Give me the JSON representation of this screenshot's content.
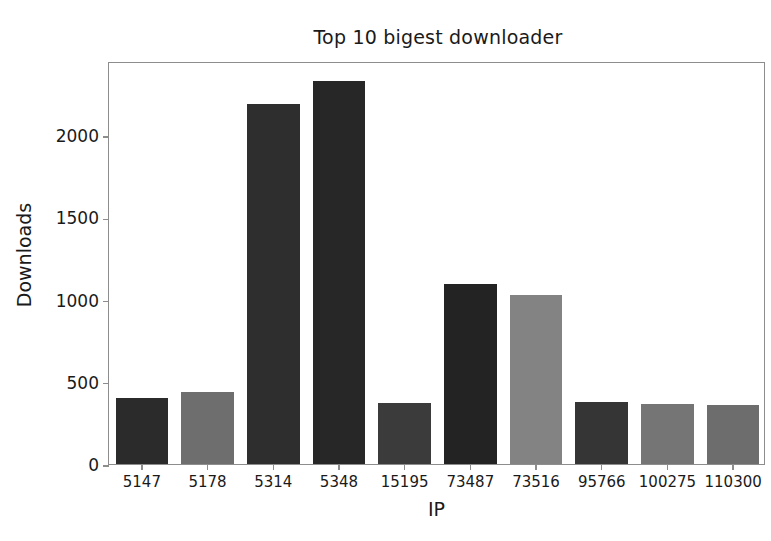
{
  "chart_data": {
    "type": "bar",
    "title": "Top 10 bigest downloader",
    "xlabel": "IP",
    "ylabel": "Downloads",
    "categories": [
      "5147",
      "5178",
      "5314",
      "5348",
      "15195",
      "73487",
      "73516",
      "95766",
      "100275",
      "110300"
    ],
    "values": [
      400,
      440,
      2190,
      2330,
      370,
      1095,
      1025,
      378,
      365,
      358
    ],
    "bar_colors": [
      "#2b2b2b",
      "#6e6e6e",
      "#2e2e2e",
      "#272727",
      "#3b3b3b",
      "#232323",
      "#838383",
      "#353535",
      "#757575",
      "#6d6d6d"
    ],
    "ylim": [
      0,
      2450
    ],
    "yticks": [
      0,
      500,
      1000,
      1500,
      2000
    ],
    "ytick_labels": [
      "0",
      "500",
      "1000",
      "1500",
      "2000"
    ],
    "grid": false,
    "legend": null,
    "axis_color": "#8d8d8d",
    "text_color": "#1a1a1a",
    "background": "#ffffff"
  }
}
